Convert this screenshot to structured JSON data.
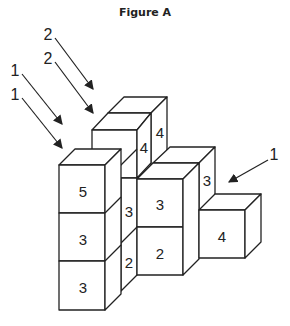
{
  "figure": {
    "title": "Figure A",
    "cube_labels": {
      "back_top_front": "4",
      "back_top_side": "4",
      "left_col_top": "5",
      "left_col_mid": "3",
      "left_col_bot": "3",
      "gap_upper": "3",
      "gap_lower": "2",
      "mid_col_top": "3",
      "mid_col_bot": "2",
      "mid_back_side": "3",
      "right_cube": "4"
    },
    "arrows": [
      {
        "label": "2",
        "position": "top-upper"
      },
      {
        "label": "2",
        "position": "top-lower"
      },
      {
        "label": "1",
        "position": "left-upper"
      },
      {
        "label": "1",
        "position": "left-lower"
      },
      {
        "label": "1",
        "position": "right"
      }
    ]
  }
}
